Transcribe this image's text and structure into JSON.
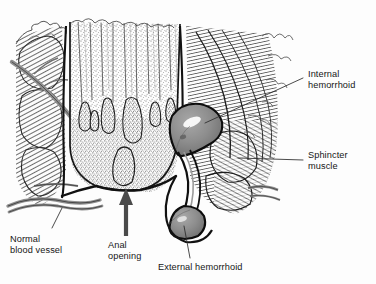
{
  "figure": {
    "kind": "medical-illustration",
    "style": "pen-and-ink engraving, stippled and cross-hatched, grayscale",
    "background_color": "#fdfdfd",
    "ink_color": "#1a1a1a",
    "hemorrhoid_fill": "#8a8a8a",
    "vessel_fill": "#8f8f8f",
    "arrow_color": "#4a4a4a",
    "leader_color": "#2b2b2b"
  },
  "labels": {
    "internal_hemorrhoid": "Internal\nhemorrhoid",
    "sphincter_muscle": "Sphincter\nmuscle",
    "normal_blood_vessel": "Normal\nblood vessel",
    "anal_opening": "Anal\nopening",
    "external_hemorrhoid": "External hemorrhoid"
  },
  "annotations": {
    "anal_opening_arrow": "up-arrow",
    "leader_lines": [
      "internal-hemorrhoid-leader",
      "sphincter-muscle-leader",
      "normal-blood-vessel-leader",
      "external-hemorrhoid-leader"
    ]
  }
}
